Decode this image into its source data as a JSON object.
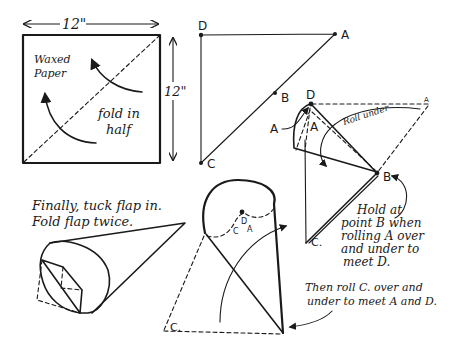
{
  "figure1": {
    "width_label": "12\"",
    "height_label": "12\"",
    "paper_label_line1": "Waxed",
    "paper_label_line2": "Paper",
    "fold_label_line1": "fold in",
    "fold_label_line2": "half"
  },
  "figure2": {
    "points": {
      "D": "D",
      "A": "A",
      "B": "B",
      "C": "C"
    }
  },
  "figure3": {
    "points": {
      "D": "D",
      "A_outer": "A",
      "A_inner": "A",
      "A_far": "A",
      "B": "B",
      "C": "C."
    },
    "roll_label": "Roll under",
    "hold_note": [
      "Hold at",
      "point B when",
      "rolling A over",
      "and under to",
      "meet D."
    ]
  },
  "figure4": {
    "points": {
      "D": "D",
      "C": "C",
      "A": "A",
      "C_corner": "C."
    },
    "roll_note": [
      "Then roll C. over and",
      "under to meet A and D."
    ]
  },
  "figure5": {
    "final_note": [
      "Finally, tuck flap in.",
      "Fold flap twice."
    ]
  }
}
